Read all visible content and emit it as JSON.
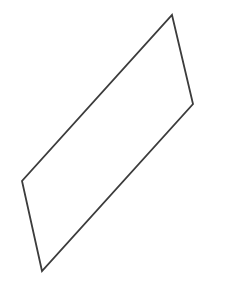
{
  "canvas": {
    "width": 228,
    "height": 295,
    "background_color": "#ffffff",
    "description": "Line drawing of a single slanted quadrilateral (parallelogram) outline on a plain white background"
  },
  "shape": {
    "name": "parallelogram",
    "kind": "quadrilateral",
    "fill_color": "#ffffff",
    "stroke_color": "#3c3c3c",
    "stroke_width": 1.8,
    "stroke_linejoin": "miter",
    "stroke_linecap": "butt",
    "vertices": [
      {
        "label": "top",
        "x": 172,
        "y": 15
      },
      {
        "label": "right",
        "x": 193,
        "y": 104
      },
      {
        "label": "bottom",
        "x": 42,
        "y": 271
      },
      {
        "label": "left",
        "x": 22,
        "y": 181
      }
    ],
    "points_attr": "172,15 193,104 42,271 22,181"
  }
}
